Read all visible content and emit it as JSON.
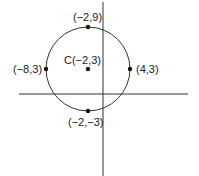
{
  "diagram": {
    "type": "coordinate-circle",
    "colors": {
      "line": "#333333",
      "point": "#111111",
      "text": "#222222",
      "background": "#ffffff"
    },
    "axes": {
      "x_axis": "horizontal",
      "y_axis": "vertical"
    },
    "circle": {
      "center_label": "C(−2,3)",
      "center": [
        -2,
        3
      ],
      "radius": 6
    },
    "points": [
      {
        "id": "top",
        "label": "(−2,9)",
        "coords": [
          -2,
          9
        ]
      },
      {
        "id": "left",
        "label": "(−8,3)",
        "coords": [
          -8,
          3
        ]
      },
      {
        "id": "right",
        "label": "(4,3)",
        "coords": [
          4,
          3
        ]
      },
      {
        "id": "bottom",
        "label": "(−2,−3)",
        "coords": [
          -2,
          -3
        ]
      }
    ]
  }
}
